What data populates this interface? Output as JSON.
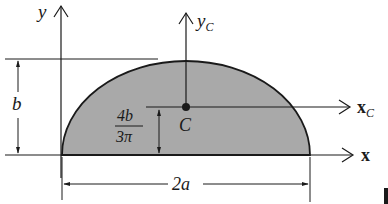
{
  "diagram": {
    "colors": {
      "fill": "#a9a9a9",
      "stroke": "#1a1a1a",
      "background": "#ffffff"
    },
    "labels": {
      "y_axis": "y",
      "yc_axis_main": "y",
      "yc_axis_sub": "C",
      "x_axis": "x",
      "xc_axis_main": "x",
      "xc_axis_sub": "C",
      "centroid": "C",
      "height_dim": "b",
      "centroid_dim_num": "4b",
      "centroid_dim_den": "3π",
      "width_dim": "2a"
    },
    "shape": {
      "type": "semi-ellipse",
      "semi_major_axis": "a",
      "semi_minor_axis": "b",
      "centroid_height": "4b/3π"
    }
  }
}
